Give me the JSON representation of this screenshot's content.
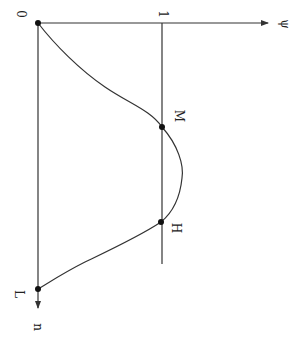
{
  "diagram": {
    "orientation": "rotated 90° clockwise",
    "labels": {
      "origin": "0",
      "tick": "1",
      "horizontal_axis": "ψ",
      "vertical_axis": "n",
      "point_m": "M",
      "point_h": "H",
      "point_l": "L"
    },
    "colors": {
      "stroke": "#333333",
      "point": "#111111",
      "background": "#ffffff"
    }
  }
}
